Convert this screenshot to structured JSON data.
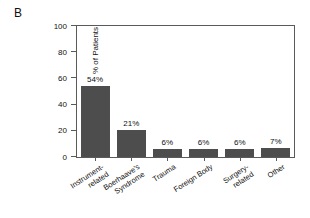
{
  "panel": {
    "label": "B"
  },
  "chart_data": {
    "type": "bar",
    "title": "",
    "subtitle": "",
    "xlabel": "",
    "ylabel": "% of Patients",
    "ylim": [
      0,
      100
    ],
    "yticks": [
      0,
      20,
      40,
      60,
      80,
      100
    ],
    "ytick_labels": [
      "0",
      "20",
      "40",
      "60",
      "80",
      "100"
    ],
    "grid": false,
    "legend": null,
    "bar_color": "#4d4d4d",
    "categories": [
      "Instrument-related",
      "Boerhaave's Syndrome",
      "Trauma",
      "Foreign Body",
      "Surgery-related",
      "Other"
    ],
    "category_lines": [
      [
        "Instrument-",
        "related"
      ],
      [
        "Boerhaave's",
        "Syndrome"
      ],
      [
        "Trauma"
      ],
      [
        "Foreign Body"
      ],
      [
        "Surgery-",
        "related"
      ],
      [
        "Other"
      ]
    ],
    "values": [
      54,
      21,
      6,
      6,
      6,
      7
    ],
    "data_labels": [
      "54%",
      "21%",
      "6%",
      "6%",
      "6%",
      "7%"
    ]
  }
}
